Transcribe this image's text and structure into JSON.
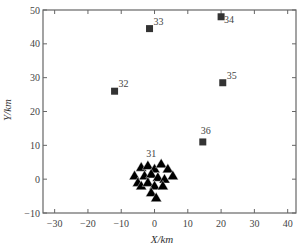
{
  "chart_data": {
    "type": "scatter",
    "title": "",
    "xlabel": "X/km",
    "ylabel": "Y/km",
    "xlim": [
      -33.5,
      42.5
    ],
    "ylim": [
      -10,
      50
    ],
    "xticks": [
      -30,
      -20,
      -10,
      0,
      10,
      20,
      30,
      40
    ],
    "yticks": [
      -10,
      0,
      10,
      20,
      30,
      40,
      50
    ],
    "grid": false,
    "legend": null,
    "series": [
      {
        "name": "stations",
        "marker": "square",
        "color": "#333333",
        "points": [
          {
            "label": "32",
            "x": -12,
            "y": 26
          },
          {
            "label": "33",
            "x": -1.5,
            "y": 44.5
          },
          {
            "label": "34",
            "x": 20,
            "y": 48
          },
          {
            "label": "35",
            "x": 20.5,
            "y": 28.5
          },
          {
            "label": "36",
            "x": 14.5,
            "y": 11
          }
        ]
      },
      {
        "name": "cluster-31",
        "label": "31",
        "marker": "triangle",
        "color": "#000000",
        "points": [
          {
            "x": -6,
            "y": 1
          },
          {
            "x": -4,
            "y": 3.5
          },
          {
            "x": -2,
            "y": 4
          },
          {
            "x": 0,
            "y": 3
          },
          {
            "x": 2,
            "y": 4.5
          },
          {
            "x": 4,
            "y": 3
          },
          {
            "x": 5.5,
            "y": 1
          },
          {
            "x": -5,
            "y": -1
          },
          {
            "x": -3,
            "y": 1
          },
          {
            "x": -1,
            "y": 1.5
          },
          {
            "x": 1,
            "y": 0.5
          },
          {
            "x": 3,
            "y": 0
          },
          {
            "x": -4,
            "y": -2
          },
          {
            "x": -2,
            "y": -1
          },
          {
            "x": 0,
            "y": -2
          },
          {
            "x": 2.5,
            "y": -2
          },
          {
            "x": -1,
            "y": -4
          },
          {
            "x": 0.5,
            "y": -5.5
          }
        ]
      }
    ]
  }
}
